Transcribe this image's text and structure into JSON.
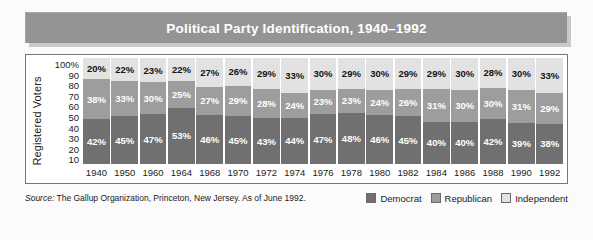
{
  "title": "Political Party Identification, 1940–1992",
  "axis": {
    "y_title": "Registered Voters",
    "y_ticks": [
      "100%",
      "90",
      "80",
      "70",
      "60",
      "50",
      "40",
      "30",
      "20",
      "10"
    ]
  },
  "source": {
    "label": "Source:",
    "text": " The Gallup Organization, Princeton, New Jersey. As of June 1992."
  },
  "legend": {
    "items": [
      {
        "label": "Democrat",
        "color": "#707070"
      },
      {
        "label": "Republican",
        "color": "#9d9d9d"
      },
      {
        "label": "Independent",
        "color": "#e2e2e2"
      }
    ]
  },
  "chart_data": {
    "type": "bar",
    "title": "Political Party Identification, 1940–1992",
    "xlabel": "",
    "ylabel": "Registered Voters",
    "ylim": [
      0,
      100
    ],
    "stacked": true,
    "grid": false,
    "legend_position": "bottom-right",
    "categories": [
      "1940",
      "1950",
      "1960",
      "1964",
      "1968",
      "1970",
      "1972",
      "1974",
      "1976",
      "1978",
      "1980",
      "1982",
      "1984",
      "1986",
      "1988",
      "1990",
      "1992"
    ],
    "series": [
      {
        "name": "Democrat",
        "color": "#707070",
        "values": [
          42,
          45,
          47,
          53,
          46,
          45,
          43,
          44,
          47,
          48,
          46,
          45,
          40,
          40,
          42,
          39,
          38
        ],
        "labels": [
          "42%",
          "45%",
          "47%",
          "53%",
          "46%",
          "45%",
          "43%",
          "44%",
          "47%",
          "48%",
          "46%",
          "45%",
          "40%",
          "40%",
          "42%",
          "39%",
          "38%"
        ]
      },
      {
        "name": "Republican",
        "color": "#9d9d9d",
        "values": [
          38,
          33,
          30,
          25,
          27,
          29,
          28,
          24,
          23,
          23,
          24,
          26,
          31,
          30,
          30,
          31,
          29
        ],
        "labels": [
          "38%",
          "33%",
          "30%",
          "25%",
          "27%",
          "29%",
          "28%",
          "24%",
          "23%",
          "23%",
          "24%",
          "26%",
          "31%",
          "30%",
          "30%",
          "31%",
          "29%"
        ]
      },
      {
        "name": "Independent",
        "color": "#e2e2e2",
        "values": [
          20,
          22,
          23,
          22,
          27,
          26,
          29,
          33,
          30,
          29,
          30,
          29,
          29,
          30,
          28,
          30,
          33
        ],
        "labels": [
          "20%",
          "22%",
          "23%",
          "22%",
          "27%",
          "26%",
          "29%",
          "33%",
          "30%",
          "29%",
          "30%",
          "29%",
          "29%",
          "30%",
          "28%",
          "30%",
          "33%"
        ]
      }
    ]
  }
}
